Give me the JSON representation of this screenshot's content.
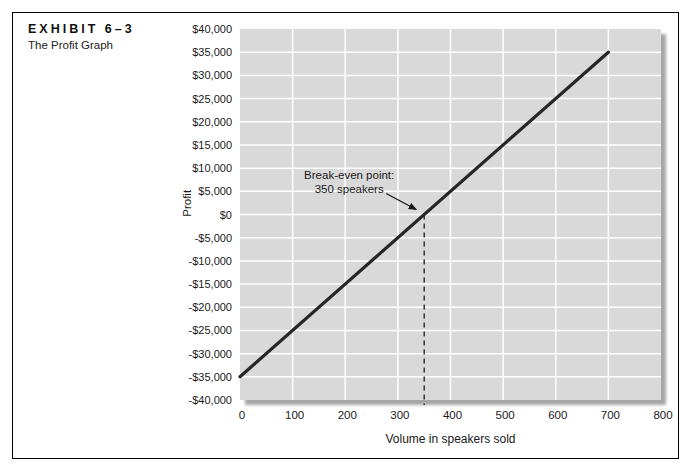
{
  "exhibit": {
    "label": "EXHIBIT 6–3",
    "subtitle": "The Profit Graph"
  },
  "colors": {
    "plot_bg": "#d9d9d9",
    "gridline": "#ffffff",
    "line": "#262626",
    "shadow": "#a6a6a6",
    "dashed": "#1a1a1a",
    "text": "#1a1a1a",
    "border": "#000000"
  },
  "chart_data": {
    "type": "line",
    "title": "The Profit Graph",
    "xlabel": "Volume in speakers sold",
    "ylabel": "Profit",
    "xlim": [
      0,
      800
    ],
    "ylim": [
      -40000,
      40000
    ],
    "grid": true,
    "legend": "none",
    "x_ticks": [
      {
        "value": 0,
        "label": "0"
      },
      {
        "value": 100,
        "label": "100"
      },
      {
        "value": 200,
        "label": "200"
      },
      {
        "value": 300,
        "label": "300"
      },
      {
        "value": 400,
        "label": "400"
      },
      {
        "value": 500,
        "label": "500"
      },
      {
        "value": 600,
        "label": "600"
      },
      {
        "value": 700,
        "label": "700"
      },
      {
        "value": 800,
        "label": "800"
      }
    ],
    "y_ticks": [
      {
        "value": 40000,
        "label": "$40,000"
      },
      {
        "value": 35000,
        "label": "$35,000"
      },
      {
        "value": 30000,
        "label": "$30,000"
      },
      {
        "value": 25000,
        "label": "$25,000"
      },
      {
        "value": 20000,
        "label": "$20,000"
      },
      {
        "value": 15000,
        "label": "$15,000"
      },
      {
        "value": 10000,
        "label": "$10,000"
      },
      {
        "value": 5000,
        "label": "$5,000"
      },
      {
        "value": 0,
        "label": "$0"
      },
      {
        "value": -5000,
        "label": "-$5,000"
      },
      {
        "value": -10000,
        "label": "-$10,000"
      },
      {
        "value": -15000,
        "label": "-$15,000"
      },
      {
        "value": -20000,
        "label": "-$20,000"
      },
      {
        "value": -25000,
        "label": "-$25,000"
      },
      {
        "value": -30000,
        "label": "-$30,000"
      },
      {
        "value": -35000,
        "label": "-$35,000"
      },
      {
        "value": -40000,
        "label": "-$40,000"
      }
    ],
    "series": [
      {
        "name": "profit-line",
        "points": [
          [
            0,
            -35000
          ],
          [
            700,
            35000
          ]
        ]
      }
    ],
    "break_even": {
      "x": 350,
      "profit": 0,
      "annotation_lines": [
        "Break-even point:",
        "350 speakers"
      ],
      "dashed_drop_to_axis": true
    }
  }
}
